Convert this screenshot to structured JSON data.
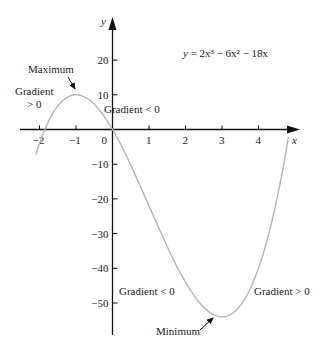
{
  "chart_data": {
    "type": "line",
    "title": "",
    "equation": "y = 2x³ − 6x² − 18x",
    "function": {
      "a3": 2,
      "a2": -6,
      "a1": -18,
      "a0": 0
    },
    "x_range": [
      -2.1,
      4.82
    ],
    "xlabel": "x",
    "ylabel": "y",
    "xlim": [
      -2.2,
      5.1
    ],
    "ylim": [
      -60,
      32
    ],
    "x_ticks": [
      -2,
      -1,
      0,
      1,
      2,
      3,
      4
    ],
    "x_tick_labels": [
      "−2",
      "−1",
      "0",
      "1",
      "2",
      "3",
      "4"
    ],
    "y_ticks": [
      20,
      10,
      -10,
      -20,
      -30,
      -40,
      -50
    ],
    "y_tick_labels": [
      "20",
      "10",
      "−10",
      "−20",
      "−30",
      "−40",
      "−50"
    ],
    "grid": false,
    "legend": false,
    "series": [
      {
        "name": "y = 2x³ − 6x² − 18x",
        "color": "#b5b5b5"
      }
    ],
    "stationary_points": [
      {
        "label": "Maximum",
        "x": -1,
        "y": 10
      },
      {
        "label": "Minimum",
        "x": 3,
        "y": -54
      }
    ],
    "annotations": [
      {
        "text_lines": [
          "Gradient",
          "> 0"
        ],
        "region": "left of maximum"
      },
      {
        "text_lines": [
          "Gradient  < 0"
        ],
        "region": "right of maximum, near origin"
      },
      {
        "text_lines": [
          "Gradient  < 0"
        ],
        "region": "left of minimum"
      },
      {
        "text_lines": [
          "Gradient  > 0"
        ],
        "region": "right of minimum"
      },
      {
        "text_lines": [
          "Maximum"
        ],
        "arrow_to": [
          -1,
          10
        ]
      },
      {
        "text_lines": [
          "Minimum"
        ],
        "arrow_to": [
          3,
          -54
        ]
      }
    ]
  },
  "labels": {
    "equation_y": "y",
    "equation_rest": " = 2x³ − 6x² − 18x",
    "maximum": "Maximum",
    "minimum": "Minimum",
    "grad_pos_left_1": "Gradient",
    "grad_pos_left_2": "> 0",
    "grad_neg_top": "Gradient  < 0",
    "grad_neg_bottom": "Gradient  < 0",
    "grad_pos_right": "Gradient  > 0",
    "x_axis": "x",
    "y_axis": "y"
  }
}
